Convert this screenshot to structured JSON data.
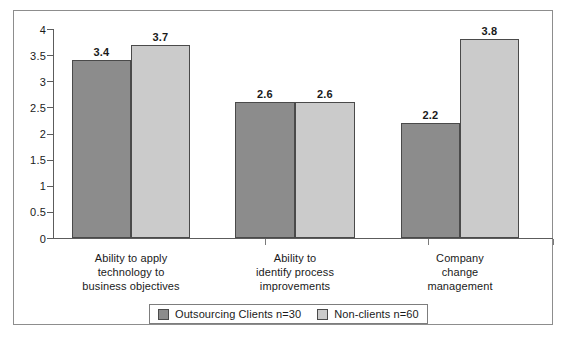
{
  "chart_data": {
    "type": "bar",
    "title": "",
    "subtitle": "",
    "xlabel": "",
    "ylabel": "",
    "ylim": [
      0,
      4
    ],
    "ytick_labels": [
      "0",
      "0.5",
      "1",
      "1.5",
      "2",
      "2.5",
      "3",
      "3.5",
      "4"
    ],
    "ytick_values": [
      0,
      0.5,
      1,
      1.5,
      2,
      2.5,
      3,
      3.5,
      4
    ],
    "grid": false,
    "legend_position": "bottom",
    "categories": [
      "Ability to apply\ntechnology to\nbusiness objectives",
      "Ability to\nidentify process\nimprovements",
      "Company\nchange\nmanagement"
    ],
    "series": [
      {
        "name": "Outsourcing Clients n=30",
        "color": "#8c8c8c",
        "values": [
          3.4,
          2.6,
          2.2
        ],
        "labels": [
          "3.4",
          "2.6",
          "2.2"
        ]
      },
      {
        "name": "Non-clients n=60",
        "color": "#cbcbcb",
        "values": [
          3.7,
          2.6,
          3.8
        ],
        "labels": [
          "3.7",
          "2.6",
          "3.8"
        ]
      }
    ]
  },
  "legend": {
    "items": [
      {
        "label": "Outsourcing Clients n=30",
        "swatch": "dark"
      },
      {
        "label": "Non-clients n=60",
        "swatch": "light"
      }
    ]
  },
  "colors": {
    "series_dark": "#8c8c8c",
    "series_light": "#cbcbcb",
    "axis": "#5c5c5c",
    "frame": "#8d8d8d",
    "text": "#1a1a1a",
    "background": "#ffffff"
  }
}
